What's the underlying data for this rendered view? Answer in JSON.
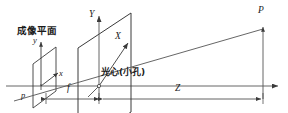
{
  "figure": {
    "name": "pinhole-camera-model-diagram",
    "title_label": "成像平面",
    "optical_center_label": "光心(小孔)",
    "colors": {
      "stroke": "#3a3a3a",
      "text": "#1a1a1a",
      "background": "#ffffff",
      "axis": "#555555"
    },
    "labels": {
      "image_plane_y_axis": "y",
      "image_plane_x_axis": "x",
      "image_point": "p",
      "world_Y_axis": "Y",
      "world_X_axis": "X",
      "world_point": "P",
      "focal_length": "f",
      "depth": "Z"
    },
    "geometry": {
      "optical_axis_y": 86,
      "optical_axis_x_start": 6,
      "optical_axis_x_end": 282,
      "pinhole": {
        "x": 131,
        "y": 86
      },
      "image_plane_center": {
        "x": 56,
        "y": 86
      },
      "world_plane_center": {
        "x": 131,
        "y": 86
      },
      "world_point_P": {
        "x": 263,
        "y": 29
      },
      "image_point_p": {
        "x": 38,
        "y": 98
      },
      "focal_length_span": {
        "x1": 62,
        "x2": 131
      },
      "depth_span": {
        "x1": 131,
        "x2": 263
      }
    }
  }
}
